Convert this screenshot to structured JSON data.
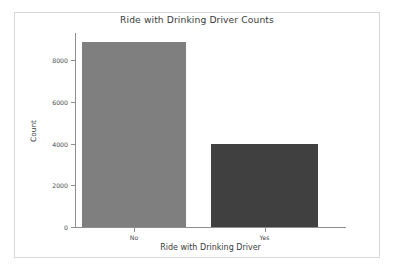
{
  "chart_data": {
    "type": "bar",
    "title": "Ride with Drinking Driver Counts",
    "xlabel": "Ride with Drinking Driver",
    "ylabel": "Count",
    "categories": [
      "No",
      "Yes"
    ],
    "values": [
      8890,
      3980
    ],
    "series": [
      {
        "name": "Count",
        "values": [
          8890,
          3980
        ]
      }
    ],
    "ylim": [
      0,
      9300
    ],
    "yticks": [
      0,
      2000,
      4000,
      6000,
      8000
    ],
    "ytick_labels": [
      "0",
      "2000",
      "4000",
      "6000",
      "8000"
    ],
    "xtick_labels": [
      "No",
      "Yes"
    ],
    "grid": false,
    "legend": "none",
    "bar_colors": [
      "#7f7f7f",
      "#404040"
    ],
    "figure_background": "#ffffff",
    "axes_color": "#8e8e8e",
    "text_color": "#3b3b3b"
  }
}
